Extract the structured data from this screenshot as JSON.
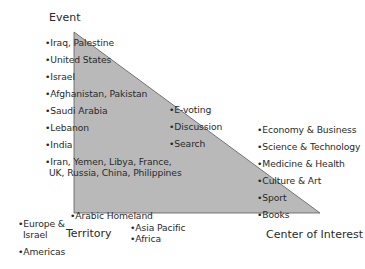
{
  "axes": {
    "event": "Event",
    "territory": "Territory",
    "center_of_interest": "Center of Interest"
  },
  "event_items": [
    "Iraq, Palestine",
    "United States",
    "Israel",
    "Afghanistan, Pakistan",
    "Saudi Arabia",
    "Lebanon",
    "India",
    "Iran, Yemen, Libya, France,",
    "UK, Russia, China, Philippines"
  ],
  "middle_items": [
    "E-voting",
    "Discussion",
    "Search"
  ],
  "interest_items": [
    "Economy & Business",
    "Science & Technology",
    "Medicine & Health",
    "Culture & Art",
    "Sport",
    "Books"
  ],
  "territory_items": {
    "arabic_homeland": "Arabic Homeland",
    "europe_line1": "Europe &",
    "europe_line2": "Israel",
    "americas": "Americas",
    "asia_pacific": "Asia Pacific",
    "africa": "Africa"
  },
  "colors": {
    "triangle_fill": "#b9b9b9",
    "triangle_stroke": "#5a5a5a",
    "text": "#2a2a2a"
  }
}
